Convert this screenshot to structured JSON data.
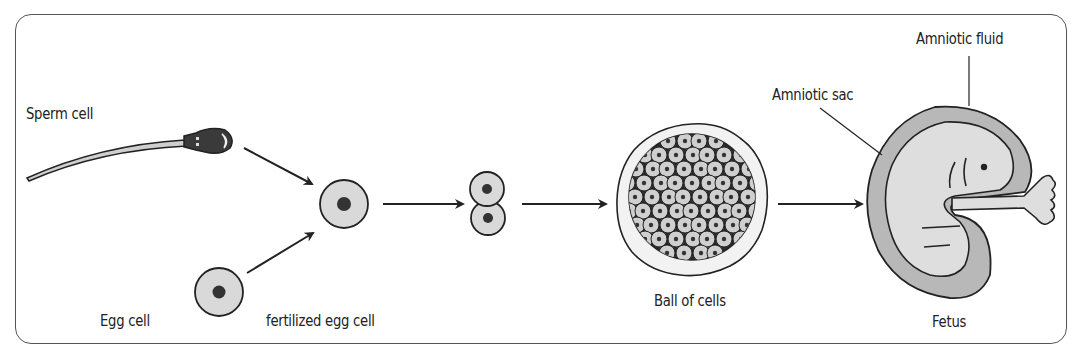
{
  "diagram": {
    "labels": {
      "sperm_cell": "Sperm cell",
      "egg_cell": "Egg cell",
      "fertilized_egg_cell": "fertilized egg cell",
      "ball_of_cells": "Ball of cells",
      "fetus": "Fetus",
      "amniotic_sac": "Amniotic sac",
      "amniotic_fluid": "Amniotic fluid"
    },
    "stages": [
      "Sperm cell",
      "Egg cell",
      "fertilized egg cell",
      "two-cell stage",
      "Ball of cells",
      "Fetus"
    ],
    "colors": {
      "line": "#222222",
      "cell_fill": "#d9d9d9",
      "nucleus": "#333333",
      "amniotic_fluid": "#b8b8b8",
      "fetus_fill": "#dedede",
      "frame": "#555555"
    }
  }
}
